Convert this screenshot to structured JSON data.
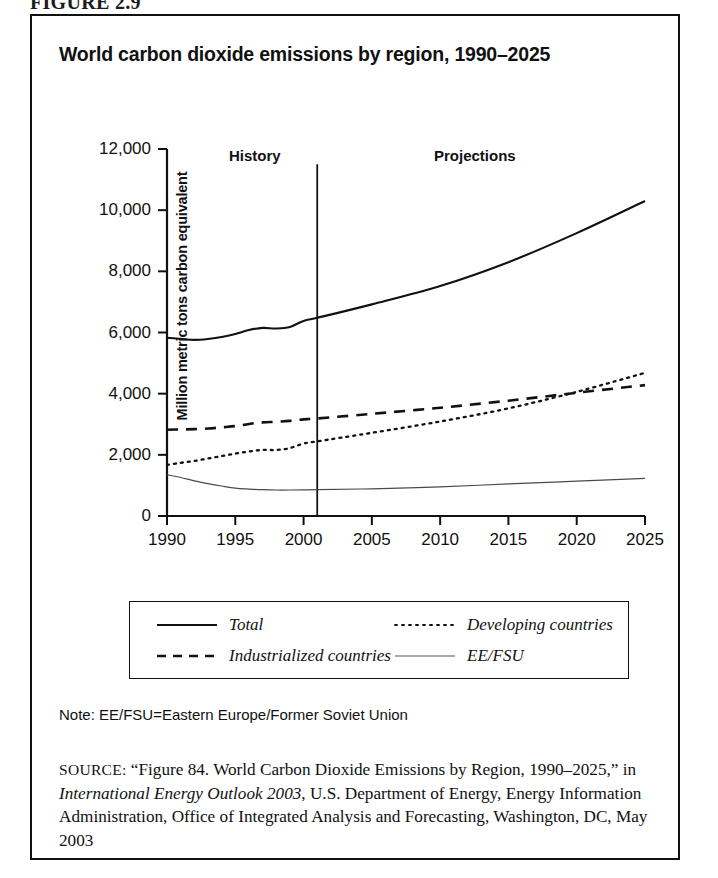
{
  "figure": {
    "number_label": "FIGURE 2.9",
    "title": "World carbon dioxide emissions by region, 1990–2025"
  },
  "chart_data": {
    "type": "line",
    "title": "World carbon dioxide emissions by region, 1990–2025",
    "xlabel": "",
    "ylabel": "Million metric tons carbon equivalent",
    "xlim": [
      1990,
      2025
    ],
    "ylim": [
      0,
      12000
    ],
    "ytick_labels": [
      "0",
      "2,000",
      "4,000",
      "6,000",
      "8,000",
      "10,000",
      "12,000"
    ],
    "ytick_values": [
      0,
      2000,
      4000,
      6000,
      8000,
      10000,
      12000
    ],
    "xtick_labels": [
      "1990",
      "1995",
      "2000",
      "2005",
      "2010",
      "2015",
      "2020",
      "2025"
    ],
    "xtick_values": [
      1990,
      1995,
      2000,
      2005,
      2010,
      2015,
      2020,
      2025
    ],
    "grid": false,
    "legend_position": "below-plot",
    "annotations": [
      {
        "text": "History",
        "x": 1994.0,
        "y": 11400
      },
      {
        "text": "Projections",
        "x": 2011.5,
        "y": 11400
      }
    ],
    "divider": {
      "x": 2001,
      "label": "history-projection divider"
    },
    "x": [
      1990,
      1991,
      1992,
      1993,
      1994,
      1995,
      1996,
      1997,
      1998,
      1999,
      2000,
      2001,
      2005,
      2010,
      2015,
      2020,
      2025
    ],
    "series": [
      {
        "name": "Total",
        "style": "solid",
        "values": [
          5830,
          5790,
          5760,
          5790,
          5850,
          5950,
          6080,
          6150,
          6130,
          6180,
          6380,
          6480,
          6920,
          7520,
          8300,
          9250,
          10300
        ]
      },
      {
        "name": "Industrialized countries",
        "style": "dashed",
        "values": [
          2820,
          2830,
          2840,
          2860,
          2900,
          2940,
          3010,
          3060,
          3080,
          3110,
          3160,
          3190,
          3340,
          3540,
          3770,
          4030,
          4280
        ]
      },
      {
        "name": "Developing countries",
        "style": "dotted",
        "values": [
          1670,
          1740,
          1800,
          1880,
          1960,
          2040,
          2110,
          2160,
          2160,
          2220,
          2370,
          2440,
          2720,
          3090,
          3520,
          4060,
          4680
        ]
      },
      {
        "name": "EE/FSU",
        "style": "thin-solid",
        "values": [
          1350,
          1260,
          1150,
          1060,
          980,
          910,
          880,
          860,
          850,
          850,
          855,
          860,
          890,
          950,
          1050,
          1140,
          1230
        ]
      }
    ]
  },
  "legend": {
    "entries": [
      {
        "label": "Total",
        "style": "solid"
      },
      {
        "label": "Developing countries",
        "style": "dotted"
      },
      {
        "label": "Industrialized countries",
        "style": "dashed"
      },
      {
        "label": "EE/FSU",
        "style": "thin-solid"
      }
    ]
  },
  "note": {
    "text": "Note: EE/FSU=Eastern Europe/Former Soviet Union"
  },
  "source": {
    "kicker": "SOURCE:",
    "part1": " “Figure 84. World Carbon Dioxide Emissions by Region, 1990–2025,” in ",
    "italic": "International Energy Outlook 2003",
    "part2": ", U.S. Department of Energy, Energy Information Administration, Office of Integrated Analysis and Forecasting, Washington, DC, May 2003"
  },
  "colors": {
    "ink": "#111111",
    "background": "#ffffff"
  }
}
